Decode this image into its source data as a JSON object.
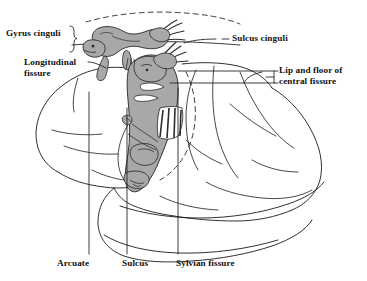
{
  "figure": {
    "type": "anatomical-line-diagram",
    "width": 367,
    "height": 281,
    "background_color": "#ffffff",
    "ink_color": "#111111",
    "homunculus_fill_color": "#a8a8a8",
    "homunculus_outline_color": "#333333"
  },
  "labels": {
    "gyrus_cinguli": "Gyrus cinguli",
    "sulcus_cinguli": "Sulcus cinguli",
    "longitudinal_fissure_line1": "Longitudinal",
    "longitudinal_fissure_line2": "fissure",
    "lip_floor_line1": "Lip and floor of",
    "lip_floor_line2": "central fissure",
    "arcuate": "Arcuate",
    "sulcus": "Sulcus",
    "sylvian_fissure": "Sylvian fissure"
  },
  "structures": {
    "brain_outline": "lateral view of cerebral hemisphere",
    "upper_homunculus": "cingulate-gyrus homunculus figure, gray filled",
    "central_homunculus": "pre/postcentral homunculus figure descending into central fissure, gray filled",
    "striped_trunk_band": "hatched trunk segments of central homunculus",
    "dashed_curve_top": "dashed line marking medial surface edge above gyrus cinguli",
    "dashed_curve_central": "dashed line marking buried central fissure cortex"
  },
  "leader_lines": {
    "gyrus_cinguli": "brace bracket pointing right into cingulate gyrus band",
    "sulcus_cinguli": "horizontal dashed-then-solid leader running left to sulcus",
    "longitudinal_fissure": "short angled leader to superior medial edge",
    "lip_floor": "small bracket with two horizontal rails into central fissure",
    "arcuate": "vertical leader rising to arcuate sulcus",
    "sulcus": "vertical leader rising to sulcus",
    "sylvian_fissure": "vertical leader rising to Sylvian fissure"
  }
}
